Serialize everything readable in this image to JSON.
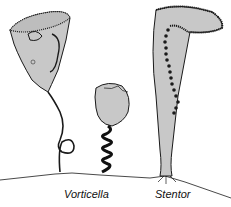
{
  "figure": {
    "labels": {
      "vorticella": "Vorticella",
      "stentor": "Stentor"
    },
    "colors": {
      "cell_fill": "#c8c8c8",
      "outline": "#1a1a1a",
      "background": "#ffffff"
    }
  }
}
